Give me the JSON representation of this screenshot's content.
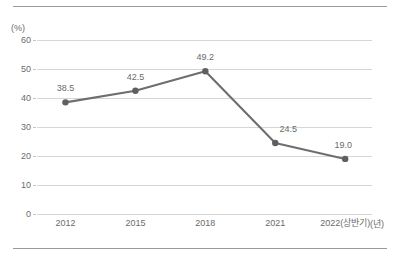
{
  "chart_data": {
    "type": "line",
    "title": "",
    "xlabel": "(년)",
    "ylabel": "(%)",
    "categories": [
      "2012",
      "2015",
      "2018",
      "2021",
      "2022(상반기)"
    ],
    "values": [
      38.5,
      42.5,
      49.2,
      24.5,
      19.0
    ],
    "point_labels": [
      "38.5",
      "42.5",
      "49.2",
      "24.5",
      "19.0"
    ],
    "ylim": [
      0,
      60
    ],
    "yticks": [
      0,
      10,
      20,
      30,
      40,
      50,
      60
    ],
    "ytick_labels": [
      "0",
      "10",
      "20",
      "30",
      "40",
      "50",
      "60"
    ],
    "grid": true,
    "legend": "none",
    "series": [
      {
        "name": "",
        "values": [
          38.5,
          42.5,
          49.2,
          24.5,
          19.0
        ]
      }
    ],
    "colors": {
      "line": "#6e6e6e",
      "marker": "#5f5f5f",
      "grid": "#d6d6d6",
      "text": "#6b6b6b",
      "rule": "#9a9a9a"
    },
    "label_offsets": [
      {
        "dx": 0,
        "dy": -9
      },
      {
        "dx": 0,
        "dy": -9
      },
      {
        "dx": 0,
        "dy": -9
      },
      {
        "dx": 13,
        "dy": -9
      },
      {
        "dx": -2,
        "dy": -9
      }
    ]
  }
}
